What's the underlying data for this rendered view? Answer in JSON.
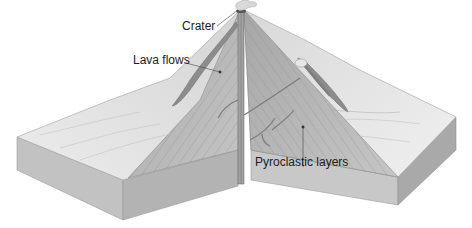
{
  "labels": {
    "crater": "Crater",
    "lava_flows": "Lava flows",
    "pyroclastic_layers": "Pyroclastic layers"
  },
  "colors": {
    "background": "#ffffff",
    "surface_light": "#e8e8e8",
    "surface_mid": "#d6d6d6",
    "cone_section": "#b8b8b8",
    "block_side": "#c4c4c4",
    "block_side_dark": "#a8a8a8",
    "lava": "#8a8a8a",
    "conduit": "#9a9a9a",
    "text": "#222222"
  }
}
